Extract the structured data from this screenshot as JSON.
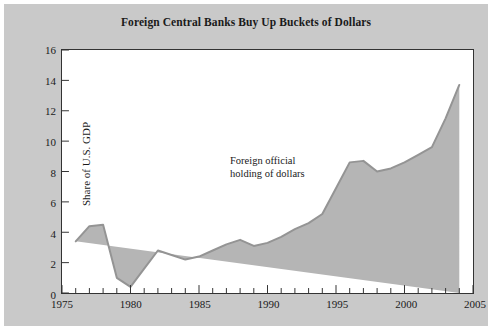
{
  "figure": {
    "background_color": "#c9c9c9",
    "plot_background_color": "#ffffff",
    "title": "Foreign Central Banks Buy Up Buckets of Dollars"
  },
  "annotation": {
    "line1": "Foreign official",
    "line2": "holding of dollars"
  },
  "chart_data": {
    "type": "area",
    "title": "Foreign Central Banks Buy Up Buckets of Dollars",
    "xlabel": "",
    "ylabel": "Share of U.S. GDP",
    "xlim": [
      1975,
      2005
    ],
    "ylim": [
      0,
      16
    ],
    "grid": false,
    "legend": null,
    "fill_color": "#b5b5b5",
    "line_color": "#949494",
    "x_major_ticks": [
      1975,
      1980,
      1985,
      1990,
      1995,
      2000,
      2005
    ],
    "x_major_tick_labels": [
      "1975",
      "1980",
      "1985",
      "1990",
      "1995",
      "2000",
      "2005"
    ],
    "x_minor_tick_step": 1,
    "y_ticks": [
      0,
      2,
      4,
      6,
      8,
      10,
      12,
      14,
      16
    ],
    "y_tick_labels": [
      "0",
      "2",
      "4",
      "6",
      "8",
      "10",
      "12",
      "14",
      "16"
    ],
    "series": [
      {
        "name": "Foreign official holding of dollars",
        "x": [
          1976,
          1977,
          1978,
          1979,
          1980,
          1981,
          1982,
          1983,
          1984,
          1985,
          1986,
          1987,
          1988,
          1989,
          1990,
          1991,
          1992,
          1993,
          1994,
          1995,
          1996,
          1997,
          1998,
          1999,
          2000,
          2001,
          2002,
          2003,
          2004
        ],
        "values": [
          3.4,
          4.4,
          4.5,
          1.0,
          0.4,
          1.6,
          2.8,
          2.5,
          2.2,
          2.4,
          2.8,
          3.2,
          3.5,
          3.1,
          3.3,
          3.7,
          4.2,
          4.6,
          5.2,
          6.9,
          8.6,
          8.7,
          8.0,
          8.2,
          8.6,
          9.1,
          9.6,
          11.5,
          13.7
        ]
      }
    ]
  }
}
